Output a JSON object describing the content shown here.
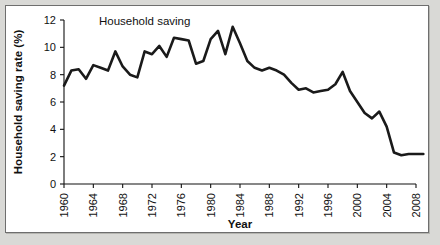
{
  "chart_data": {
    "type": "line",
    "title": "",
    "xlabel": "Year",
    "ylabel": "Household saving rate (%)",
    "xlim": [
      1960,
      2008
    ],
    "ylim": [
      0,
      12
    ],
    "grid": false,
    "legend_position": "inline-annotation",
    "annotations": [
      {
        "text": "Household saving",
        "x": 1971,
        "y": 11.6
      }
    ],
    "xticks": [
      1960,
      1964,
      1968,
      1972,
      1976,
      1980,
      1984,
      1988,
      1992,
      1996,
      2000,
      2004,
      2008
    ],
    "xtick_labels": [
      "1960",
      "1964",
      "1968",
      "1972",
      "1976",
      "1980",
      "1984",
      "1988",
      "1992",
      "1996",
      "2000",
      "2004",
      "2008"
    ],
    "yticks": [
      0,
      2,
      4,
      6,
      8,
      10,
      12
    ],
    "ytick_labels": [
      "0",
      "2",
      "4",
      "6",
      "8",
      "10",
      "12"
    ],
    "series": [
      {
        "name": "Household saving",
        "color": "#1a1a1a",
        "x": [
          1960,
          1961,
          1962,
          1963,
          1964,
          1965,
          1966,
          1967,
          1968,
          1969,
          1970,
          1971,
          1972,
          1973,
          1974,
          1975,
          1976,
          1977,
          1978,
          1979,
          1980,
          1981,
          1982,
          1983,
          1984,
          1985,
          1986,
          1987,
          1988,
          1989,
          1990,
          1991,
          1992,
          1993,
          1994,
          1995,
          1996,
          1997,
          1998,
          1999,
          2000,
          2001,
          2002,
          2003,
          2004,
          2005,
          2006
        ],
        "values": [
          7.2,
          8.3,
          8.4,
          7.7,
          8.7,
          8.5,
          8.3,
          9.7,
          8.6,
          8.0,
          7.8,
          9.7,
          9.5,
          10.1,
          9.3,
          10.7,
          10.6,
          10.5,
          8.8,
          9.0,
          10.6,
          11.2,
          9.5,
          11.5,
          10.3,
          9.0,
          8.5,
          8.3,
          8.5,
          8.3,
          8.0,
          7.4,
          6.9,
          7.0,
          6.7,
          6.8,
          6.9,
          7.3,
          8.2,
          6.8,
          6.0,
          5.2,
          4.8,
          5.3,
          4.2,
          2.3,
          2.1
        ],
        "values_tail": [
          2.2,
          2.2,
          2.2
        ]
      }
    ],
    "x_tail": [
      2006,
      2007
    ]
  }
}
